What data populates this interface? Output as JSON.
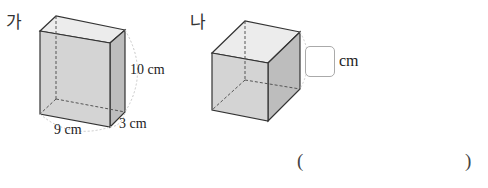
{
  "problem": {
    "figures": [
      {
        "label": "가",
        "shape": "rectangular-prism",
        "dimensions": {
          "width": "9 cm",
          "depth": "3 cm",
          "height": "10 cm"
        }
      },
      {
        "label": "나",
        "shape": "cube",
        "edge_blank_unit": "cm"
      }
    ],
    "answer": {
      "open_paren": "(",
      "close_paren": ")",
      "value": ""
    }
  },
  "colors": {
    "front_face": "#d4d4d4",
    "top_face": "#ececec",
    "side_face": "#bdbdbd",
    "edge": "#333333",
    "hidden_edge": "#555555",
    "dim_arc": "#c8c8c8"
  }
}
